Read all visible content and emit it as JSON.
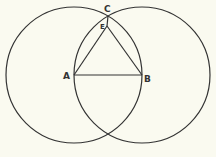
{
  "diagram": {
    "background": "#fafaf0",
    "stroke": "#333333",
    "points": [
      {
        "label": "A",
        "x": 74,
        "y": 75
      },
      {
        "label": "B",
        "x": 142,
        "y": 75
      },
      {
        "label": "C",
        "x": 108,
        "y": 16
      },
      {
        "label": "E",
        "x": 107,
        "y": 26
      }
    ],
    "circles": [
      {
        "name": "circle-centered-A",
        "cx": 74,
        "cy": 75,
        "r": 68
      },
      {
        "name": "circle-centered-B",
        "cx": 142,
        "cy": 75,
        "r": 68
      }
    ],
    "segments": [
      [
        "A",
        "B"
      ],
      [
        "A",
        "E"
      ],
      [
        "B",
        "E"
      ],
      [
        "E",
        "C"
      ]
    ],
    "labels": {
      "a": "A",
      "b": "B",
      "c": "C",
      "e": "E"
    }
  }
}
